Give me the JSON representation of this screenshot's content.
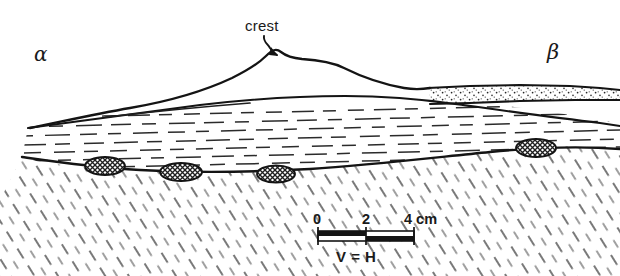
{
  "figure": {
    "type": "geological-cross-section",
    "background_color": "#ffffff",
    "ink_color": "#1a1a1a"
  },
  "labels": {
    "left_flank": "α",
    "right_flank": "β",
    "crest": "crest"
  },
  "scale_bar": {
    "ticks": [
      "0",
      "2",
      "4 cm"
    ],
    "tick_values": [
      0,
      2,
      4
    ],
    "unit": "cm",
    "note": "V = H",
    "segments": 2,
    "segment_length_cm": 2
  },
  "units": [
    {
      "name": "upper-bedform",
      "pattern": "blank",
      "description": "uppermost depositional bedform with crest"
    },
    {
      "name": "stippled-lens",
      "pattern": "stipple",
      "description": "stippled sandy lens on the beta flank"
    },
    {
      "name": "laminated-unit",
      "pattern": "dashed-horizontal-laminae",
      "description": "horizontally laminated middle unit"
    },
    {
      "name": "basement-unit",
      "pattern": "diagonal-hatching",
      "description": "diagonally hatched lower unit"
    }
  ],
  "clasts": {
    "count": 4,
    "pattern": "cross-hatched",
    "description": "cross-hatched clasts resting on the basal erosional contact"
  }
}
